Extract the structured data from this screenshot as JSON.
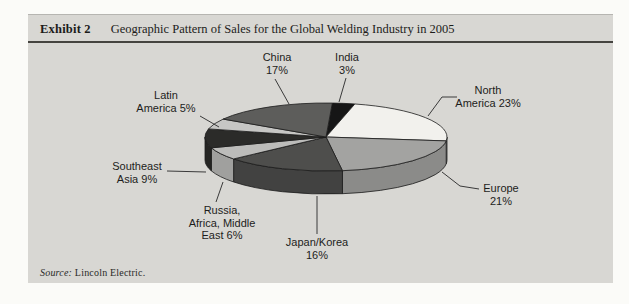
{
  "exhibit": {
    "label": "Exhibit 2",
    "title": "Geographic Pattern of Sales for the Global Welding Industry in 2005",
    "source_prefix": "Source:",
    "source_text": "Lincoln Electric."
  },
  "colors": {
    "panel_bg": "#d8d7d3",
    "header_rule": "#45443f",
    "slice_stroke": "#1c1c1c",
    "leader_line": "#3a3a3a",
    "label_text": "#1d1d1b"
  },
  "chart_data": {
    "type": "pie",
    "title": "Geographic Pattern of Sales for the Global Welding Industry in 2005",
    "unit": "%",
    "effect": "3d",
    "clockwise": true,
    "start_angle_deg": 3,
    "legend_position": "none",
    "slices": [
      {
        "label": "India",
        "value": 3,
        "color": "#161616"
      },
      {
        "label": "North America",
        "value": 23,
        "color": "#f2f1ed"
      },
      {
        "label": "Europe",
        "value": 21,
        "color": "#a3a3a1"
      },
      {
        "label": "Japan/Korea",
        "value": 16,
        "color": "#4e4e4c"
      },
      {
        "label": "Russia, Africa, Middle East",
        "value": 6,
        "color": "#bcbcba"
      },
      {
        "label": "Southeast Asia",
        "value": 9,
        "color": "#2b2b29"
      },
      {
        "label": "Latin America",
        "value": 5,
        "color": "#c6c6c4"
      },
      {
        "label": "China",
        "value": 17,
        "color": "#5d5d5b"
      }
    ],
    "labels_layout": [
      {
        "name": "china",
        "lines": [
          "China",
          "17%"
        ],
        "x": 277,
        "y": 51,
        "leader": [
          [
            275,
            79
          ],
          [
            289,
            104
          ]
        ]
      },
      {
        "name": "india",
        "lines": [
          "India",
          "3%"
        ],
        "x": 347,
        "y": 51,
        "leader": [
          [
            346,
            78
          ],
          [
            339,
            102
          ]
        ]
      },
      {
        "name": "north-america",
        "lines": [
          "North",
          "America 23%"
        ],
        "x": 488,
        "y": 84,
        "leader": [
          [
            457,
            97
          ],
          [
            442,
            97
          ],
          [
            428,
            116
          ]
        ]
      },
      {
        "name": "europe",
        "lines": [
          "Europe",
          "21%"
        ],
        "x": 501,
        "y": 182,
        "leader": [
          [
            479,
            189
          ],
          [
            460,
            186
          ],
          [
            442,
            172
          ]
        ]
      },
      {
        "name": "japan-korea",
        "lines": [
          "Japan/Korea",
          "16%"
        ],
        "x": 317,
        "y": 236,
        "leader": [
          [
            317,
            234
          ],
          [
            317,
            196
          ]
        ]
      },
      {
        "name": "russia-africa-middle-east",
        "lines": [
          "Russia,",
          "Africa, Middle",
          "East 6%"
        ],
        "x": 222,
        "y": 204,
        "leader": [
          [
            216,
            202
          ],
          [
            223,
            182
          ]
        ]
      },
      {
        "name": "southeast-asia",
        "lines": [
          "Southeast",
          "Asia 9%"
        ],
        "x": 137,
        "y": 160,
        "leader": [
          [
            167,
            171
          ],
          [
            206,
            172
          ]
        ]
      },
      {
        "name": "latin-america",
        "lines": [
          "Latin",
          "America 5%"
        ],
        "x": 166,
        "y": 89,
        "leader": [
          [
            200,
            116
          ],
          [
            219,
            127
          ]
        ]
      }
    ]
  }
}
